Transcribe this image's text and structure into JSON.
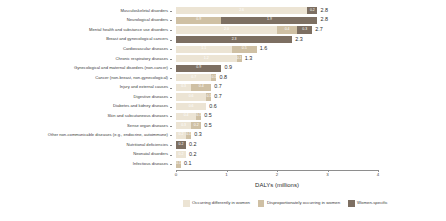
{
  "chart_data": {
    "type": "bar",
    "orientation": "horizontal",
    "stacked": true,
    "title": "",
    "xlabel": "DALYs (millions)",
    "ylabel": "",
    "xlim": [
      0,
      4
    ],
    "xticks": [
      "0",
      "1",
      "2",
      "3",
      "4"
    ],
    "grid": false,
    "legend_position": "bottom",
    "categories": [
      "Musculoskeletal disorders",
      "Neurological disorders",
      "Mental health and substance use disorders",
      "Breast and gynecological cancers",
      "Cardiovascular diseases",
      "Chronic respiratory diseases",
      "Gynecological and maternal disorders (non-cancer)",
      "Cancer (non-breast, non-gynecological)",
      "Injury and external causes",
      "Digestive diseases",
      "Diabetes and kidney diseases",
      "Skin and subcutaneous diseases",
      "Sense organ diseases",
      "Other non-communicable diseases (e.g., endocrine, autoimmune)",
      "Nutritional deficiencies",
      "Neonatal disorders",
      "Infectious diseases"
    ],
    "series": [
      {
        "name": "Occurring differently in women",
        "color": "#ece4d4",
        "values": [
          2.6,
          0.0,
          2.0,
          0.0,
          1.1,
          1.2,
          0.0,
          0.7,
          0.3,
          0.6,
          0.6,
          0.4,
          0.3,
          0.2,
          0.0,
          0.2,
          0.0
        ]
      },
      {
        "name": "Disproportionately occurring in women",
        "color": "#cfc0a4",
        "values": [
          0.0,
          0.9,
          0.4,
          0.0,
          0.5,
          0.1,
          0.0,
          0.1,
          0.4,
          0.1,
          0.0,
          0.1,
          0.2,
          0.1,
          0.0,
          0.0,
          0.1
        ]
      },
      {
        "name": "Women-specific",
        "color": "#7d6f62",
        "values": [
          0.2,
          1.9,
          0.3,
          2.3,
          0.0,
          0.0,
          0.9,
          0.0,
          0.0,
          0.0,
          0.0,
          0.0,
          0.0,
          0.0,
          0.2,
          0.0,
          0.0
        ]
      }
    ],
    "totals": [
      "2.8",
      "2.8",
      "2.7",
      "2.3",
      "1.6",
      "1.3",
      "0.9",
      "0.8",
      "0.7",
      "0.7",
      "0.6",
      "0.5",
      "0.5",
      "0.3",
      "0.2",
      "0.2",
      "0.1"
    ],
    "segment_labels": [
      [
        "2.6",
        "",
        "0.2"
      ],
      [
        "",
        "0.9",
        "1.9"
      ],
      [
        "2.0",
        "0.4",
        "0.3"
      ],
      [
        "",
        "",
        "2.3"
      ],
      [
        "1.1",
        "0.5",
        ""
      ],
      [
        "1.2",
        "0.1",
        ""
      ],
      [
        "",
        "",
        "0.9"
      ],
      [
        "0.7",
        "0.1",
        ""
      ],
      [
        "0.3",
        "0.4",
        ""
      ],
      [
        "0.6",
        "0.1",
        ""
      ],
      [
        "0.6",
        "",
        ""
      ],
      [
        "0.4",
        "0.1",
        ""
      ],
      [
        "0.3",
        "0.2",
        ""
      ],
      [
        "0.2",
        "0.1",
        ""
      ],
      [
        "",
        "",
        "0.2"
      ],
      [
        "0.2",
        "",
        ""
      ],
      [
        "",
        "0.1",
        ""
      ]
    ]
  }
}
